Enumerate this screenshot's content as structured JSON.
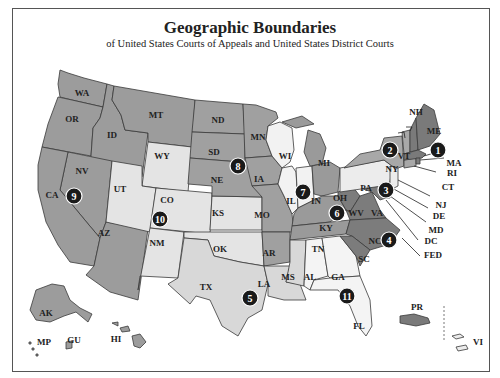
{
  "header": {
    "title": "Geographic Boundaries",
    "subtitle": "of United States Courts of Appeals and United States District Courts"
  },
  "colors": {
    "circuit_1": "#7a7a7a",
    "circuit_2": "#a8a8a8",
    "circuit_3": "#ececec",
    "circuit_4": "#7c7c7c",
    "circuit_5": "#d8d8d8",
    "circuit_6": "#9a9a9a",
    "circuit_7": "#f2f2f2",
    "circuit_8": "#a0a0a0",
    "circuit_9": "#9c9c9c",
    "circuit_10": "#e4e4e4",
    "circuit_11": "#f4f4f4",
    "badge": "#1a1a1a",
    "border": "#555555"
  },
  "circuits": [
    {
      "number": "1",
      "states": [
        "ME",
        "NH",
        "MA",
        "RI",
        "PR"
      ]
    },
    {
      "number": "2",
      "states": [
        "NY",
        "VT",
        "CT"
      ]
    },
    {
      "number": "3",
      "states": [
        "PA",
        "NJ",
        "DE",
        "VI"
      ]
    },
    {
      "number": "4",
      "states": [
        "MD",
        "VA",
        "WV",
        "NC",
        "SC"
      ]
    },
    {
      "number": "5",
      "states": [
        "TX",
        "LA",
        "MS"
      ]
    },
    {
      "number": "6",
      "states": [
        "MI",
        "OH",
        "KY",
        "TN"
      ]
    },
    {
      "number": "7",
      "states": [
        "WI",
        "IL",
        "IN"
      ]
    },
    {
      "number": "8",
      "states": [
        "ND",
        "SD",
        "NE",
        "MN",
        "IA",
        "MO",
        "AR"
      ]
    },
    {
      "number": "9",
      "states": [
        "WA",
        "OR",
        "CA",
        "NV",
        "ID",
        "MT",
        "AZ",
        "AK",
        "HI",
        "GU",
        "MP"
      ]
    },
    {
      "number": "10",
      "states": [
        "WY",
        "UT",
        "CO",
        "KS",
        "NM",
        "OK"
      ]
    },
    {
      "number": "11",
      "states": [
        "AL",
        "GA",
        "FL"
      ]
    }
  ],
  "labels": {
    "WA": "WA",
    "OR": "OR",
    "CA": "CA",
    "NV": "NV",
    "ID": "ID",
    "MT": "MT",
    "AZ": "AZ",
    "AK": "AK",
    "HI": "HI",
    "GU": "GU",
    "MP": "MP",
    "WY": "WY",
    "UT": "UT",
    "CO": "CO",
    "KS": "KS",
    "NM": "NM",
    "OK": "OK",
    "ND": "ND",
    "SD": "SD",
    "NE": "NE",
    "MN": "MN",
    "IA": "IA",
    "MO": "MO",
    "AR": "AR",
    "WI": "WI",
    "IL": "IL",
    "IN": "IN",
    "MI": "MI",
    "OH": "OH",
    "KY": "KY",
    "TN": "TN",
    "TX": "TX",
    "LA": "LA",
    "MS": "MS",
    "AL": "AL",
    "GA": "GA",
    "FL": "FL",
    "PA": "PA",
    "NY": "NY",
    "VT": "VT",
    "NH": "NH",
    "ME": "ME",
    "MA": "MA",
    "RI": "RI",
    "CT": "CT",
    "NJ": "NJ",
    "DE": "DE",
    "MD": "MD",
    "DC": "DC",
    "FED": "FED",
    "WV": "WV",
    "VA": "VA",
    "NC": "NC",
    "SC": "SC",
    "PR": "PR",
    "VI": "VI"
  },
  "badges": {
    "c1": "1",
    "c2": "2",
    "c3": "3",
    "c4": "4",
    "c5": "5",
    "c6": "6",
    "c7": "7",
    "c8": "8",
    "c9": "9",
    "c10": "10",
    "c11": "11"
  }
}
